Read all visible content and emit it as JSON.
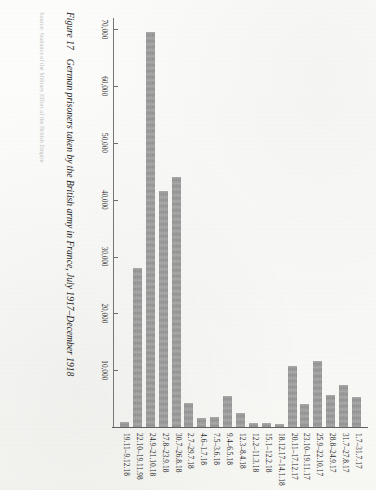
{
  "figure": {
    "number_label": "Figure 17",
    "caption": "German prisoners taken by the British army in France, July 1917–December 1918",
    "source_note": "Source: Statistics of the Military Effort of the British Empire"
  },
  "axis": {
    "tick_labels": [
      "70,000",
      "60,000",
      "50,000",
      "40,000",
      "30,000",
      "20,000",
      "10,000"
    ],
    "tick_values": [
      70000,
      60000,
      50000,
      40000,
      30000,
      20000,
      10000
    ]
  },
  "colors": {
    "bar": "#8d8d8d",
    "axis": "#6e6e6e",
    "text": "#2b2b2b",
    "page": "#fbfbf9"
  },
  "chart_data": {
    "type": "bar",
    "orientation": "horizontal",
    "title": "German prisoners taken by the British army in France, July 1917–December 1918",
    "xlabel": "",
    "ylabel": "",
    "xlim": [
      0,
      72000
    ],
    "grid": false,
    "legend": null,
    "categories": [
      "1.7–31.7.17",
      "31.7–27.8.17",
      "28.8–24.9.17",
      "25.9–22.10.17",
      "23.10–19.11.17",
      "20.11–17.12.17",
      "18.12.17–14.1.18",
      "15.1–12.2.18",
      "12.2–11.3.18",
      "12.3–8.4.18",
      "9.4–6.5.18",
      "7.5–3.6.18",
      "4.6–1.7.18",
      "2.7–29.7.18",
      "30.7–26.8.18",
      "27.8–23.9.18",
      "24.9–21.10.18",
      "22.10–19.11.98",
      "19.11–9.12.18"
    ],
    "values": [
      5300,
      7400,
      5600,
      11600,
      4000,
      10800,
      600,
      700,
      700,
      2400,
      5500,
      1700,
      1500,
      4200,
      44000,
      41500,
      69500,
      28000,
      900
    ]
  }
}
